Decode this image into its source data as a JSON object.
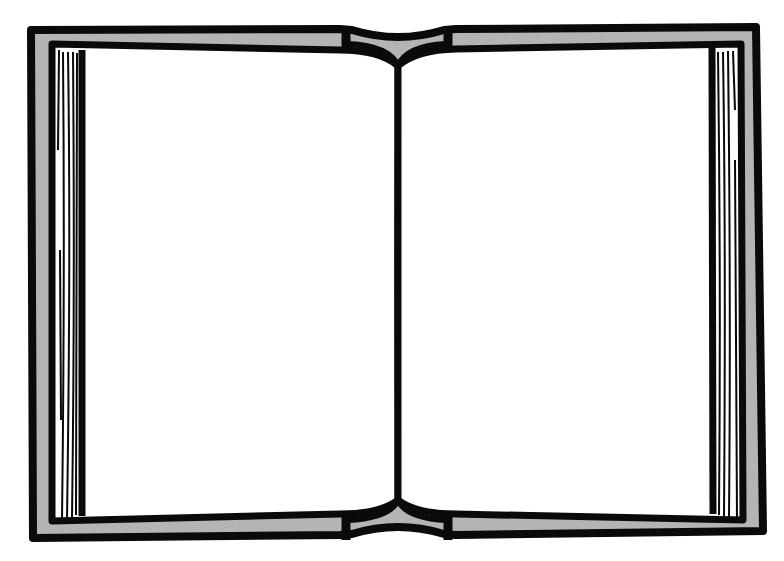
{
  "illustration": {
    "subject": "open-book",
    "style": "black-and-white clip art outline",
    "colors": {
      "background": "#ffffff",
      "ink": "#0a0a0a",
      "cover": "#b4b4b4",
      "page": "#ffffff"
    },
    "parts": [
      "cover",
      "left-page",
      "right-page",
      "spine",
      "left-page-edges",
      "right-page-edges"
    ]
  }
}
